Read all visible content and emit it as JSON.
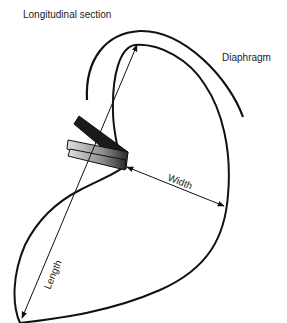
{
  "figure": {
    "title": "Longitudinal section",
    "labels": {
      "diaphragm": "Diaphragm",
      "width": "Width",
      "length": "Length"
    },
    "colors": {
      "line": "#111111",
      "probe_dark": "#1a1a1a",
      "probe_light": "#bdbdbd",
      "background": "#ffffff"
    }
  }
}
